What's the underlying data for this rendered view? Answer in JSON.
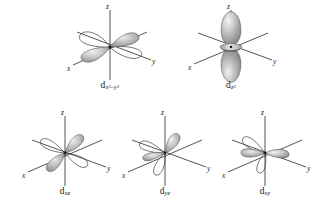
{
  "figure": {
    "title": "",
    "background_color": "#ffffff",
    "axis_color": "#2a2a2a",
    "lobe_fill_light": "#e6e6e6",
    "lobe_fill_mid": "#b8b8b8",
    "lobe_fill_dark": "#8f8f8f",
    "label_color": "#1b1b1b"
  },
  "axes": {
    "x": "x",
    "y": "y",
    "z": "z"
  },
  "orbitals": [
    {
      "id": "dx2y2",
      "base": "d",
      "sub_main": "x",
      "sub_exp1": "2",
      "sub_minus": "–y",
      "sub_exp2": "2",
      "plain_label": "dx2–y2",
      "row": "top",
      "position": 1
    },
    {
      "id": "dz2",
      "base": "d",
      "sub_main": "z",
      "sub_exp1": "2",
      "sub_minus": "",
      "sub_exp2": "",
      "plain_label": "dz2",
      "row": "top",
      "position": 2
    },
    {
      "id": "dxz",
      "base": "d",
      "sub_main": "xz",
      "sub_exp1": "",
      "sub_minus": "",
      "sub_exp2": "",
      "plain_label": "dxz",
      "row": "bottom",
      "position": 1
    },
    {
      "id": "dyz",
      "base": "d",
      "sub_main": "yz",
      "sub_exp1": "",
      "sub_minus": "",
      "sub_exp2": "",
      "plain_label": "dyz",
      "row": "bottom",
      "position": 2
    },
    {
      "id": "dxy",
      "base": "d",
      "sub_main": "xy",
      "sub_exp1": "",
      "sub_minus": "",
      "sub_exp2": "",
      "plain_label": "dxy",
      "row": "bottom",
      "position": 3
    }
  ]
}
